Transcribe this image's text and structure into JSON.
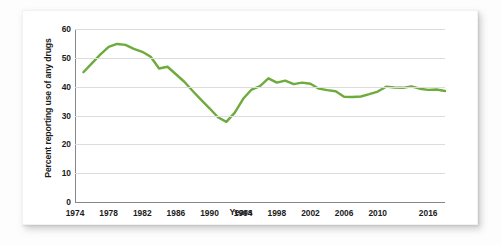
{
  "figure": {
    "background_color": "#ffffff",
    "line_color": "#6cab3c",
    "grid_color": "#dcdcdc",
    "axis_color": "#878787"
  },
  "chart_data": {
    "type": "line",
    "title": "",
    "subtitle": "",
    "xlabel": "Years",
    "ylabel": "Percent reporting use of any drugs",
    "xlim": [
      1974,
      2018
    ],
    "ylim": [
      0,
      60
    ],
    "grid": "horizontal",
    "legend": "none",
    "y_ticks": [
      0,
      10,
      20,
      30,
      40,
      50,
      60
    ],
    "y_tick_labels": [
      "0",
      "10",
      "20",
      "30",
      "40",
      "50",
      "60"
    ],
    "x_ticks": [
      1974,
      1978,
      1982,
      1986,
      1990,
      1994,
      1998,
      2002,
      2006,
      2010,
      2016
    ],
    "x_tick_labels": [
      "1974",
      "1978",
      "1982",
      "1986",
      "1990",
      "1994",
      "1998",
      "2002",
      "2006",
      "2010",
      "2016"
    ],
    "series": [
      {
        "name": "Percent reporting use of any drugs",
        "color": "#6cab3c",
        "x": [
          1975,
          1976,
          1977,
          1978,
          1979,
          1980,
          1981,
          1982,
          1983,
          1984,
          1985,
          1986,
          1987,
          1988,
          1989,
          1990,
          1991,
          1992,
          1993,
          1994,
          1995,
          1996,
          1997,
          1998,
          1999,
          2000,
          2001,
          2002,
          2003,
          2004,
          2005,
          2006,
          2007,
          2008,
          2009,
          2010,
          2011,
          2012,
          2013,
          2014,
          2015,
          2016,
          2017,
          2018
        ],
        "values": [
          45.0,
          48.1,
          51.1,
          53.8,
          54.8,
          54.5,
          53.1,
          52.1,
          50.4,
          46.3,
          46.9,
          44.3,
          41.7,
          38.5,
          35.4,
          32.5,
          29.4,
          27.8,
          31.0,
          35.8,
          39.0,
          40.2,
          42.9,
          41.4,
          42.1,
          40.9,
          41.4,
          41.0,
          39.3,
          38.8,
          38.4,
          36.5,
          36.4,
          36.6,
          37.4,
          38.3,
          40.0,
          39.7,
          39.6,
          40.1,
          39.3,
          38.9,
          39.0,
          38.5
        ]
      }
    ]
  }
}
